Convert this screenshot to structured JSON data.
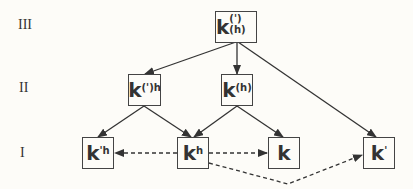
{
  "levels": {
    "III": "III",
    "II": "II",
    "I": "I"
  },
  "nodes": {
    "top": {
      "base": "k",
      "sup": "(')(h)"
    },
    "mid_left": {
      "base": "k",
      "sup": "(')h"
    },
    "mid_right": {
      "base": "k",
      "sup": "(h)"
    },
    "bot_kph": {
      "base": "k",
      "sup": "'h"
    },
    "bot_kh": {
      "base": "k",
      "sup": "h"
    },
    "bot_k": {
      "base": "k",
      "sup": ""
    },
    "bot_kp": {
      "base": "k",
      "sup": "'"
    }
  },
  "colors": {
    "line": "#333333",
    "background": "#fdfcf8"
  }
}
